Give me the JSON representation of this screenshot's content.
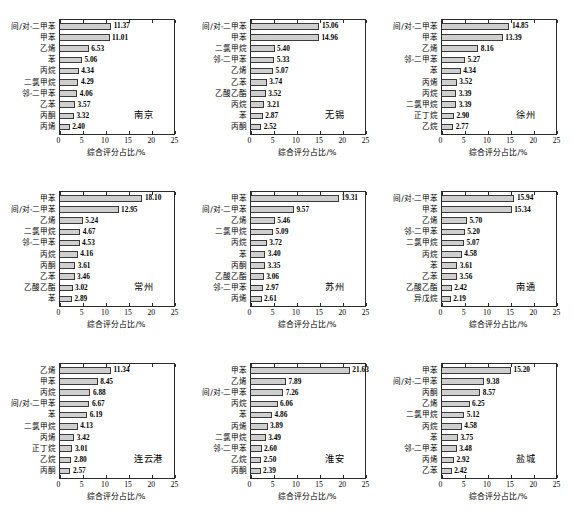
{
  "figure": {
    "axis_title": "综合评分占比/%",
    "x_ticks": [
      "0",
      "5",
      "10",
      "15",
      "20",
      "25"
    ],
    "bar_fill": "#cfcfcf",
    "bar_edge": "#3a3a3a",
    "axis_color": "#2b2b2b"
  },
  "chart_data": [
    {
      "type": "bar",
      "title": "南京",
      "xlabel": "综合评分占比/%",
      "ylabel": "",
      "xlim": [
        0,
        25
      ],
      "grid": false,
      "categories": [
        "间/对-二甲苯",
        "甲苯",
        "乙烯",
        "苯",
        "丙烷",
        "二氯甲烷",
        "邻-二甲苯",
        "乙苯",
        "丙酮",
        "丙烯"
      ],
      "values": [
        11.37,
        11.01,
        6.53,
        5.06,
        4.34,
        4.29,
        4.06,
        3.57,
        3.32,
        2.4
      ],
      "labels": [
        "11.37",
        "11.01",
        "6.53",
        "5.06",
        "4.34",
        "4.29",
        "4.06",
        "3.57",
        "3.32",
        "2.40"
      ]
    },
    {
      "type": "bar",
      "title": "无锡",
      "xlabel": "综合评分占比/%",
      "ylabel": "",
      "xlim": [
        0,
        25
      ],
      "grid": false,
      "categories": [
        "间/对-二甲苯",
        "甲苯",
        "二氯甲烷",
        "邻-二甲苯",
        "乙烯",
        "乙苯",
        "乙酸乙酯",
        "丙烷",
        "苯",
        "丙酮"
      ],
      "values": [
        15.06,
        14.96,
        5.4,
        5.33,
        5.07,
        3.74,
        3.52,
        3.21,
        2.87,
        2.52
      ],
      "labels": [
        "15.06",
        "14.96",
        "5.40",
        "5.33",
        "5.07",
        "3.74",
        "3.52",
        "3.21",
        "2.87",
        "2.52"
      ]
    },
    {
      "type": "bar",
      "title": "徐州",
      "xlabel": "综合评分占比/%",
      "ylabel": "",
      "xlim": [
        0,
        25
      ],
      "grid": false,
      "categories": [
        "间/对-二甲苯",
        "甲苯",
        "乙烯",
        "邻-二甲苯",
        "苯",
        "丙烯",
        "丙烷",
        "二氯甲烷",
        "正丁烷",
        "乙烷"
      ],
      "values": [
        14.85,
        13.39,
        8.16,
        5.27,
        4.34,
        3.52,
        3.39,
        3.39,
        2.9,
        2.77
      ],
      "labels": [
        "14.85",
        "13.39",
        "8.16",
        "5.27",
        "4.34",
        "3.52",
        "3.39",
        "3.39",
        "2.90",
        "2.77"
      ]
    },
    {
      "type": "bar",
      "title": "常州",
      "xlabel": "综合评分占比/%",
      "ylabel": "",
      "xlim": [
        0,
        25
      ],
      "grid": false,
      "categories": [
        "甲苯",
        "间/对-二甲苯",
        "乙烯",
        "二氯甲烷",
        "邻-二甲苯",
        "丙烷",
        "丙酮",
        "乙苯",
        "乙酸乙酯",
        "苯"
      ],
      "values": [
        18.1,
        12.95,
        5.24,
        4.67,
        4.53,
        4.16,
        3.61,
        3.46,
        3.02,
        2.89
      ],
      "labels": [
        "18.10",
        "12.95",
        "5.24",
        "4.67",
        "4.53",
        "4.16",
        "3.61",
        "3.46",
        "3.02",
        "2.89"
      ]
    },
    {
      "type": "bar",
      "title": "苏州",
      "xlabel": "综合评分占比/%",
      "ylabel": "",
      "xlim": [
        0,
        25
      ],
      "grid": false,
      "categories": [
        "甲苯",
        "间/对-二甲苯",
        "乙烯",
        "二氯甲烷",
        "丙烷",
        "苯",
        "丙酮",
        "乙酸乙酯",
        "邻-二甲苯",
        "丙烯"
      ],
      "values": [
        19.31,
        9.57,
        5.46,
        5.09,
        3.72,
        3.4,
        3.35,
        3.06,
        2.97,
        2.61
      ],
      "labels": [
        "19.31",
        "9.57",
        "5.46",
        "5.09",
        "3.72",
        "3.40",
        "3.35",
        "3.06",
        "2.97",
        "2.61"
      ]
    },
    {
      "type": "bar",
      "title": "南通",
      "xlabel": "综合评分占比/%",
      "ylabel": "",
      "xlim": [
        0,
        25
      ],
      "grid": false,
      "categories": [
        "间/对-二甲苯",
        "甲苯",
        "乙烯",
        "邻-二甲苯",
        "二氯甲烷",
        "丙烷",
        "苯",
        "乙苯",
        "乙酸乙酯",
        "异戊烷"
      ],
      "values": [
        15.94,
        15.34,
        5.7,
        5.2,
        5.07,
        4.58,
        3.61,
        3.56,
        2.42,
        2.19
      ],
      "labels": [
        "15.94",
        "15.34",
        "5.70",
        "5.20",
        "5.07",
        "4.58",
        "3.61",
        "3.56",
        "2.42",
        "2.19"
      ]
    },
    {
      "type": "bar",
      "title": "连云港",
      "xlabel": "综合评分占比/%",
      "ylabel": "",
      "xlim": [
        0,
        25
      ],
      "grid": false,
      "categories": [
        "乙烯",
        "甲苯",
        "丙烷",
        "间/对-二甲苯",
        "苯",
        "二氯甲烷",
        "丙烯",
        "正丁烷",
        "乙烷",
        "丙酮"
      ],
      "values": [
        11.34,
        8.45,
        6.88,
        6.67,
        6.19,
        4.13,
        3.42,
        3.01,
        2.8,
        2.57
      ],
      "labels": [
        "11.34",
        "8.45",
        "6.88",
        "6.67",
        "6.19",
        "4.13",
        "3.42",
        "3.01",
        "2.80",
        "2.57"
      ]
    },
    {
      "type": "bar",
      "title": "淮安",
      "xlabel": "综合评分占比/%",
      "ylabel": "",
      "xlim": [
        0,
        25
      ],
      "grid": false,
      "categories": [
        "甲苯",
        "乙烯",
        "间/对-二甲苯",
        "丙烷",
        "苯",
        "丙烯",
        "二氯甲烷",
        "邻-二甲苯",
        "乙烷",
        "丙酮"
      ],
      "values": [
        21.63,
        7.89,
        7.26,
        6.06,
        4.86,
        3.89,
        3.49,
        2.6,
        2.5,
        2.39
      ],
      "labels": [
        "21.63",
        "7.89",
        "7.26",
        "6.06",
        "4.86",
        "3.89",
        "3.49",
        "2.60",
        "2.50",
        "2.39"
      ]
    },
    {
      "type": "bar",
      "title": "盐城",
      "xlabel": "综合评分占比/%",
      "ylabel": "",
      "xlim": [
        0,
        25
      ],
      "grid": false,
      "categories": [
        "甲苯",
        "间/对-二甲苯",
        "丙酮",
        "乙烯",
        "二氯甲烷",
        "丙烷",
        "苯",
        "邻-二甲苯",
        "丙烯",
        "乙苯"
      ],
      "values": [
        15.2,
        9.38,
        8.57,
        6.25,
        5.12,
        4.58,
        3.75,
        3.48,
        2.92,
        2.42
      ],
      "labels": [
        "15.20",
        "9.38",
        "8.57",
        "6.25",
        "5.12",
        "4.58",
        "3.75",
        "3.48",
        "2.92",
        "2.42"
      ]
    }
  ]
}
